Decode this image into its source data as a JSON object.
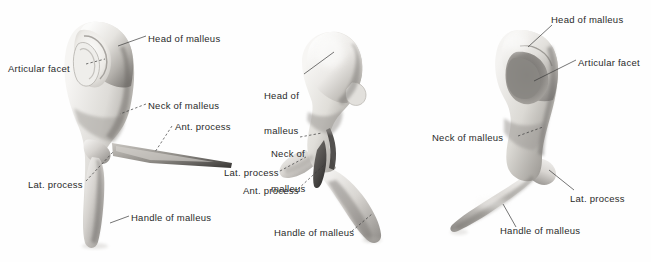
{
  "plate": {
    "title": "Malleus",
    "subject": "malleus",
    "view_count": 3,
    "background_color": "#fefefe",
    "ink_color": "#2a2a2a",
    "bone_light": "#f2f1ef",
    "bone_mid": "#c9c7c3",
    "bone_shadow": "#8d8a86",
    "bone_dark": "#5e5b58",
    "leader_color": "#3a3a3a"
  },
  "figures": [
    {
      "id": "figure-left",
      "name": "left-view",
      "view": "posterior",
      "labels": [
        {
          "id": "l-head",
          "name": "head-of-malleus",
          "text": "Head of malleus",
          "lines": [
            "Head of malleus"
          ],
          "x": 148,
          "y": 33,
          "align": "left"
        },
        {
          "id": "l-facet",
          "name": "articular-facet",
          "text": "Articular facet",
          "lines": [
            "Articular facet"
          ],
          "x": 8,
          "y": 63,
          "align": "left"
        },
        {
          "id": "l-neck",
          "name": "neck-of-malleus",
          "text": "Neck of malleus",
          "lines": [
            "Neck of malleus"
          ],
          "x": 148,
          "y": 100,
          "align": "left"
        },
        {
          "id": "l-ant",
          "name": "anterior-process",
          "text": "Ant. process",
          "lines": [
            "Ant. process"
          ],
          "x": 175,
          "y": 121,
          "align": "left"
        },
        {
          "id": "l-lat",
          "name": "lateral-process",
          "text": "Lat. process",
          "lines": [
            "Lat. process"
          ],
          "x": 28,
          "y": 179,
          "align": "left"
        },
        {
          "id": "l-handle",
          "name": "handle-of-malleus",
          "text": "Handle of malleus",
          "lines": [
            "Handle of malleus"
          ],
          "x": 131,
          "y": 212,
          "align": "left"
        }
      ]
    },
    {
      "id": "figure-middle",
      "name": "middle-view",
      "view": "medial",
      "labels": [
        {
          "id": "m-head",
          "name": "head-of-malleus",
          "text": "Head of malleus",
          "lines": [
            "Head of",
            "malleus"
          ],
          "x": 264,
          "y": 67,
          "align": "left"
        },
        {
          "id": "m-neck",
          "name": "neck-of-malleus",
          "text": "Neck of malleus",
          "lines": [
            "Neck of",
            "malleus"
          ],
          "x": 271,
          "y": 125,
          "align": "left"
        },
        {
          "id": "m-lat",
          "name": "lateral-process",
          "text": "Lat. process",
          "lines": [
            "Lat. process"
          ],
          "x": 224,
          "y": 167,
          "align": "left"
        },
        {
          "id": "m-ant",
          "name": "anterior-process",
          "text": "Ant. process",
          "lines": [
            "Ant. process"
          ],
          "x": 243,
          "y": 185,
          "align": "left"
        },
        {
          "id": "m-handle",
          "name": "handle-of-malleus",
          "text": "Handle of malleus",
          "lines": [
            "Handle of malleus"
          ],
          "x": 274,
          "y": 227,
          "align": "left"
        }
      ]
    },
    {
      "id": "figure-right",
      "name": "right-view",
      "view": "anterior",
      "labels": [
        {
          "id": "r-head",
          "name": "head-of-malleus",
          "text": "Head of malleus",
          "lines": [
            "Head of malleus"
          ],
          "x": 551,
          "y": 14,
          "align": "left"
        },
        {
          "id": "r-facet",
          "name": "articular-facet",
          "text": "Articular facet",
          "lines": [
            "Articular facet"
          ],
          "x": 578,
          "y": 57,
          "align": "left"
        },
        {
          "id": "r-neck",
          "name": "neck-of-malleus",
          "text": "Neck of malleus",
          "lines": [
            "Neck of malleus"
          ],
          "x": 432,
          "y": 132,
          "align": "left"
        },
        {
          "id": "r-lat",
          "name": "lateral-process",
          "text": "Lat. process",
          "lines": [
            "Lat. process"
          ],
          "x": 570,
          "y": 193,
          "align": "left"
        },
        {
          "id": "r-handle",
          "name": "handle-of-malleus",
          "text": "Handle of malleus",
          "lines": [
            "Handle of malleus"
          ],
          "x": 500,
          "y": 225,
          "align": "left"
        }
      ]
    }
  ]
}
